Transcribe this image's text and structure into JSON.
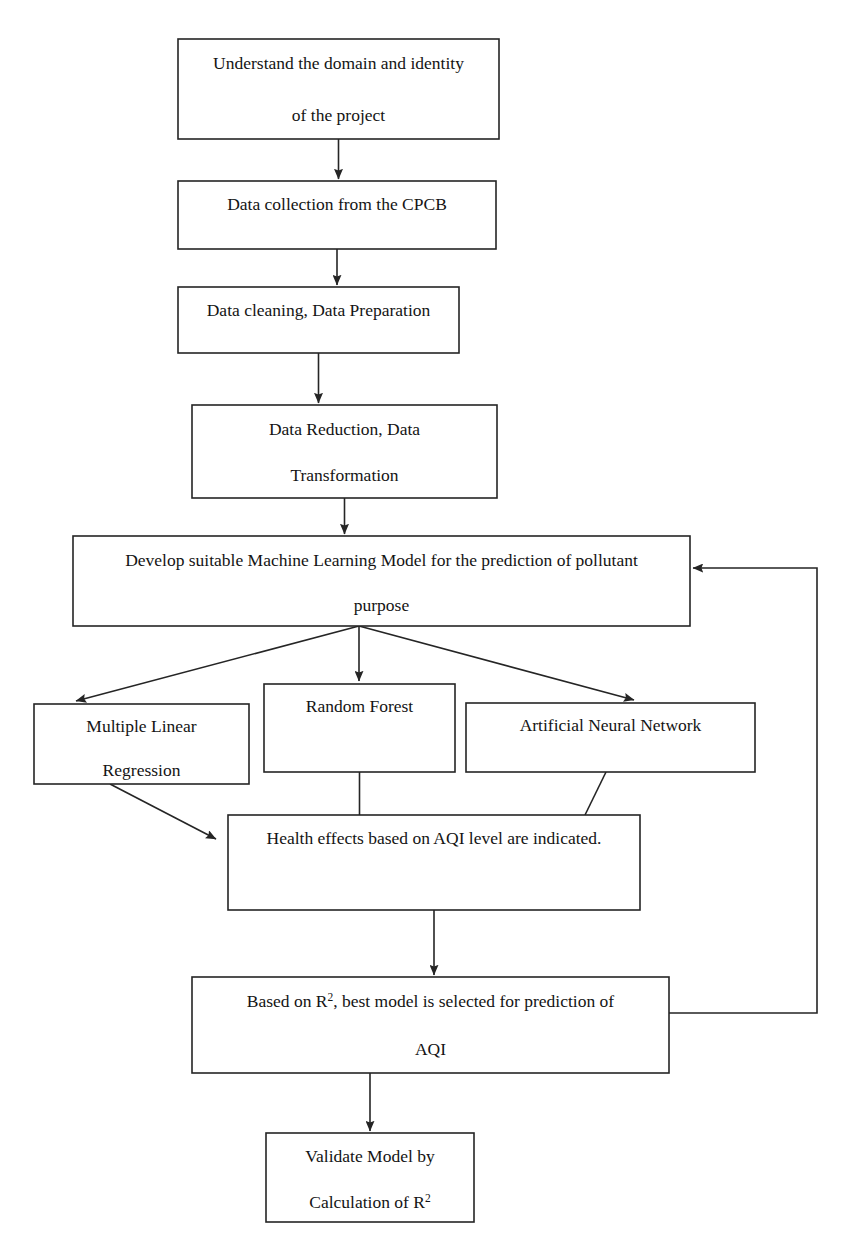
{
  "diagram": {
    "type": "flowchart",
    "orientation": "top-to-bottom",
    "stroke_color": "#252525",
    "background_color": "#ffffff",
    "text_color": "#141414",
    "nodes": [
      {
        "id": "understand-domain",
        "lines": [
          "Understand the domain and identity",
          "of the project"
        ],
        "shape": "rectangle",
        "x": 178,
        "y": 39,
        "w": 321,
        "h": 100
      },
      {
        "id": "data-collection",
        "lines": [
          "Data collection from the CPCB"
        ],
        "shape": "rectangle",
        "x": 178,
        "y": 181,
        "w": 318,
        "h": 68
      },
      {
        "id": "data-cleaning",
        "lines": [
          "Data cleaning, Data Preparation"
        ],
        "shape": "rectangle",
        "x": 178,
        "y": 287,
        "w": 281,
        "h": 66
      },
      {
        "id": "data-reduction",
        "lines": [
          "Data Reduction, Data",
          "Transformation"
        ],
        "shape": "rectangle",
        "x": 192,
        "y": 405,
        "w": 305,
        "h": 93
      },
      {
        "id": "develop-model",
        "lines": [
          "Develop suitable Machine Learning Model for the prediction of pollutant",
          "purpose"
        ],
        "shape": "rectangle",
        "x": 73,
        "y": 536,
        "w": 617,
        "h": 90
      },
      {
        "id": "multiple-linear-regression",
        "lines": [
          "Multiple Linear",
          "Regression"
        ],
        "shape": "rectangle",
        "x": 34,
        "y": 704,
        "w": 215,
        "h": 80
      },
      {
        "id": "random-forest",
        "lines": [
          "Random Forest"
        ],
        "shape": "rectangle",
        "x": 264,
        "y": 684,
        "w": 191,
        "h": 88
      },
      {
        "id": "artificial-neural-network",
        "lines": [
          "Artificial Neural Network"
        ],
        "shape": "rectangle",
        "x": 466,
        "y": 703,
        "w": 289,
        "h": 69
      },
      {
        "id": "health-effects",
        "lines": [
          "Health effects based on AQI level are indicated."
        ],
        "shape": "rectangle",
        "x": 228,
        "y": 815,
        "w": 412,
        "h": 95
      },
      {
        "id": "best-model-selection",
        "lines": [
          "Based on R2, best model is selected for prediction of",
          "AQI"
        ],
        "shape": "rectangle",
        "x": 192,
        "y": 977,
        "w": 477,
        "h": 96
      },
      {
        "id": "validate-model",
        "lines": [
          "Validate Model by",
          "Calculation of R2"
        ],
        "shape": "rectangle",
        "x": 266,
        "y": 1133,
        "w": 208,
        "h": 89
      }
    ],
    "edges": [
      {
        "id": "edge-understand-to-collection",
        "from": "understand-domain",
        "to": "data-collection",
        "style": "arrow",
        "label": ""
      },
      {
        "id": "edge-collection-to-cleaning",
        "from": "data-collection",
        "to": "data-cleaning",
        "style": "arrow",
        "label": ""
      },
      {
        "id": "edge-cleaning-to-reduction",
        "from": "data-cleaning",
        "to": "data-reduction",
        "style": "arrow",
        "label": ""
      },
      {
        "id": "edge-reduction-to-develop",
        "from": "data-reduction",
        "to": "develop-model",
        "style": "arrow",
        "label": ""
      },
      {
        "id": "edge-develop-to-mlr",
        "from": "develop-model",
        "to": "multiple-linear-regression",
        "style": "arrow",
        "label": ""
      },
      {
        "id": "edge-develop-to-rf",
        "from": "develop-model",
        "to": "random-forest",
        "style": "arrow",
        "label": ""
      },
      {
        "id": "edge-develop-to-ann",
        "from": "develop-model",
        "to": "artificial-neural-network",
        "style": "arrow",
        "label": ""
      },
      {
        "id": "edge-mlr-to-health",
        "from": "multiple-linear-regression",
        "to": "health-effects",
        "style": "arrow",
        "label": ""
      },
      {
        "id": "edge-rf-to-health",
        "from": "random-forest",
        "to": "health-effects",
        "style": "line",
        "label": ""
      },
      {
        "id": "edge-ann-to-health",
        "from": "artificial-neural-network",
        "to": "health-effects",
        "style": "line",
        "label": ""
      },
      {
        "id": "edge-health-to-best-model",
        "from": "health-effects",
        "to": "best-model-selection",
        "style": "arrow",
        "label": ""
      },
      {
        "id": "edge-best-model-to-validate",
        "from": "best-model-selection",
        "to": "validate-model",
        "style": "arrow",
        "label": ""
      },
      {
        "id": "edge-feedback-to-develop",
        "from": "best-model-selection",
        "to": "develop-model",
        "style": "arrow-feedback",
        "label": ""
      }
    ]
  }
}
